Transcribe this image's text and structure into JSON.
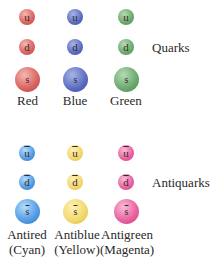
{
  "quarks": {
    "group_label": "Quarks",
    "columns": [
      {
        "name": "Red",
        "color": "#d9625e",
        "highlight": "#f4b8b4",
        "particles": [
          "u",
          "d",
          "s"
        ]
      },
      {
        "name": "Blue",
        "color": "#5a6cc0",
        "highlight": "#a9b4e6",
        "particles": [
          "u",
          "d",
          "s"
        ]
      },
      {
        "name": "Green",
        "color": "#6aa86e",
        "highlight": "#b6dab6",
        "particles": [
          "u",
          "d",
          "s"
        ]
      }
    ]
  },
  "antiquarks": {
    "group_label": "Antiquarks",
    "columns": [
      {
        "name": "Antired",
        "sub": "(Cyan)",
        "color": "#4f9be3",
        "highlight": "#b6dbfa",
        "particles": [
          "u",
          "d",
          "s"
        ]
      },
      {
        "name": "Antiblue",
        "sub": "(Yellow)",
        "color": "#f2d86a",
        "highlight": "#fcf0b8",
        "particles": [
          "u",
          "d",
          "s"
        ]
      },
      {
        "name": "Antigreen",
        "sub": "(Magenta)",
        "color": "#e8609e",
        "highlight": "#f8bcd8",
        "particles": [
          "u",
          "d",
          "s"
        ]
      }
    ]
  }
}
